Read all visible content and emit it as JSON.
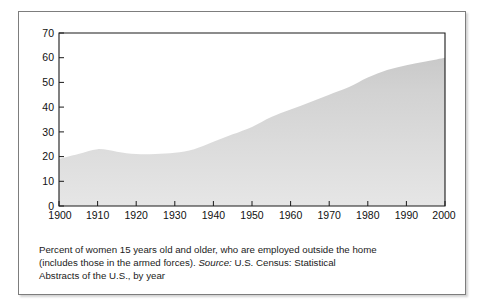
{
  "chart_data": {
    "type": "area",
    "title": "",
    "xlabel": "",
    "ylabel": "",
    "xlim": [
      1900,
      2000
    ],
    "ylim": [
      0,
      70
    ],
    "grid": false,
    "legend": null,
    "x_ticks": [
      "1900",
      "1910",
      "1920",
      "1930",
      "1940",
      "1950",
      "1960",
      "1970",
      "1980",
      "1990",
      "2000"
    ],
    "y_ticks": [
      "0",
      "10",
      "20",
      "30",
      "40",
      "50",
      "60",
      "70"
    ],
    "series": [
      {
        "name": "Percent of women 15 years old and older employed outside the home",
        "x": [
          1900,
          1905,
          1910,
          1915,
          1920,
          1925,
          1930,
          1935,
          1940,
          1945,
          1950,
          1955,
          1960,
          1965,
          1970,
          1975,
          1980,
          1985,
          1990,
          1995,
          2000
        ],
        "values": [
          19,
          21,
          23,
          22,
          21,
          21,
          21.5,
          23,
          26,
          29,
          32,
          36,
          39,
          42,
          45,
          48,
          52,
          55,
          57,
          58.5,
          60
        ]
      }
    ],
    "fill_color": "#d3d3d3",
    "caption_line_1": "Percent of women 15 years old and older, who are employed outside the home",
    "caption_line_2_pre": "(includes those in the armed forces). ",
    "caption_line_2_italic": "Source:",
    "caption_line_2_post": " U.S. Census: Statistical",
    "caption_line_3": "Abstracts of the U.S., by year"
  },
  "figure": {
    "border_color": "#7d7d7d",
    "background": "#ffffff",
    "axis_color": "#1a1a1a"
  }
}
